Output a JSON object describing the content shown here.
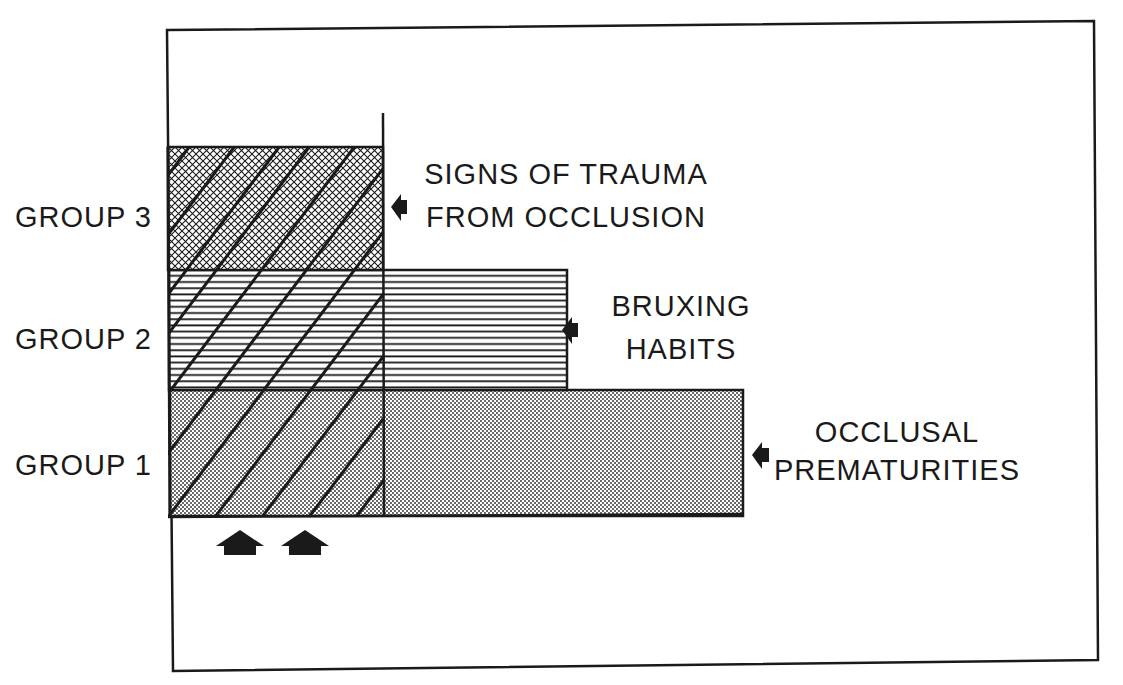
{
  "figure": {
    "groups": [
      {
        "id": "group-3",
        "label": "GROUP 3"
      },
      {
        "id": "group-2",
        "label": "GROUP 2"
      },
      {
        "id": "group-1",
        "label": "GROUP 1"
      }
    ],
    "annotations": [
      {
        "id": "trauma",
        "lines": [
          "SIGNS OF TRAUMA",
          "FROM OCCLUSION"
        ],
        "pattern": "crosshatch"
      },
      {
        "id": "bruxing",
        "lines": [
          "BRUXING",
          "HABITS"
        ],
        "pattern": "horizontal-lines"
      },
      {
        "id": "prematurities",
        "lines": [
          "OCCLUSAL",
          "PREMATURITIES"
        ],
        "pattern": "dots"
      }
    ],
    "overlay": {
      "pattern": "diagonal-lines",
      "pointers": 2
    },
    "colors": {
      "ink": "#1a1a1a",
      "background": "#ffffff"
    }
  }
}
